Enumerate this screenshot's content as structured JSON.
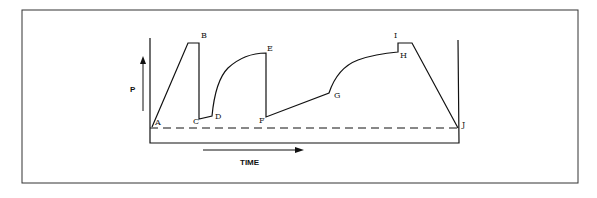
{
  "diagram": {
    "y_axis_label": "P",
    "x_axis_label": "TIME",
    "points": [
      {
        "id": "A",
        "label": "A"
      },
      {
        "id": "B",
        "label": "B"
      },
      {
        "id": "C",
        "label": "C"
      },
      {
        "id": "D",
        "label": "D"
      },
      {
        "id": "E",
        "label": "E"
      },
      {
        "id": "F",
        "label": "F"
      },
      {
        "id": "G",
        "label": "G"
      },
      {
        "id": "H",
        "label": "H"
      },
      {
        "id": "I",
        "label": "I"
      },
      {
        "id": "J",
        "label": "J"
      }
    ],
    "baseline_style": "dashed",
    "colors": {
      "line": "#111111",
      "frame": "#333333",
      "background": "#ffffff"
    }
  }
}
